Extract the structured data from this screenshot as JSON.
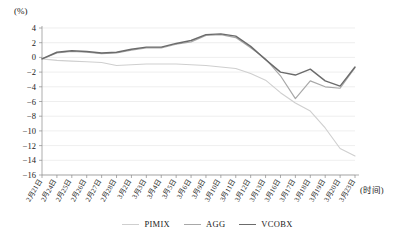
{
  "chart_data": {
    "type": "line",
    "title": "",
    "subtitle": "",
    "xlabel": "(时间)",
    "ylabel": "(%)",
    "ylim": [
      -16,
      4
    ],
    "ytick_step": 2,
    "yticks": [
      4,
      2,
      0,
      -2,
      -4,
      -6,
      -8,
      -10,
      -12,
      -14,
      -16
    ],
    "grid": true,
    "grid_axis": "y",
    "legend_position": "bottom-center",
    "categories": [
      "2月21日",
      "2月24日",
      "2月25日",
      "2月26日",
      "2月27日",
      "2月28日",
      "3月2日",
      "3月3日",
      "3月4日",
      "3月5日",
      "3月6日",
      "3月9日",
      "3月10日",
      "3月11日",
      "3月12日",
      "3月13日",
      "3月16日",
      "3月17日",
      "3月18日",
      "3月19日",
      "3月20日",
      "3月23日"
    ],
    "series": [
      {
        "name": "PIMIX",
        "color": "#cfcfcf",
        "values": [
          -0.2,
          -0.4,
          -0.5,
          -0.6,
          -0.7,
          -1.1,
          -1.0,
          -0.9,
          -0.9,
          -0.9,
          -1.0,
          -1.1,
          -1.3,
          -1.5,
          -2.2,
          -3.1,
          -4.8,
          -6.2,
          -7.3,
          -9.6,
          -12.4,
          -13.4
        ]
      },
      {
        "name": "AGG",
        "color": "#a8a8a8",
        "values": [
          -0.2,
          0.6,
          0.8,
          0.7,
          0.5,
          0.6,
          1.0,
          1.3,
          1.3,
          1.8,
          2.1,
          3.0,
          3.1,
          2.7,
          1.3,
          -0.2,
          -2.5,
          -5.6,
          -3.2,
          -4.0,
          -4.2,
          -1.4
        ]
      },
      {
        "name": "VCOBX",
        "color": "#6b6b6b",
        "values": [
          -0.2,
          0.7,
          0.9,
          0.8,
          0.6,
          0.7,
          1.1,
          1.4,
          1.4,
          1.9,
          2.3,
          3.1,
          3.2,
          2.9,
          1.5,
          -0.3,
          -2.0,
          -2.4,
          -1.6,
          -3.2,
          -3.9,
          -1.3
        ]
      }
    ]
  },
  "legend": {
    "items": [
      {
        "label": "PIMIX",
        "color": "#cfcfcf"
      },
      {
        "label": "AGG",
        "color": "#a8a8a8"
      },
      {
        "label": "VCOBX",
        "color": "#6b6b6b"
      }
    ]
  }
}
